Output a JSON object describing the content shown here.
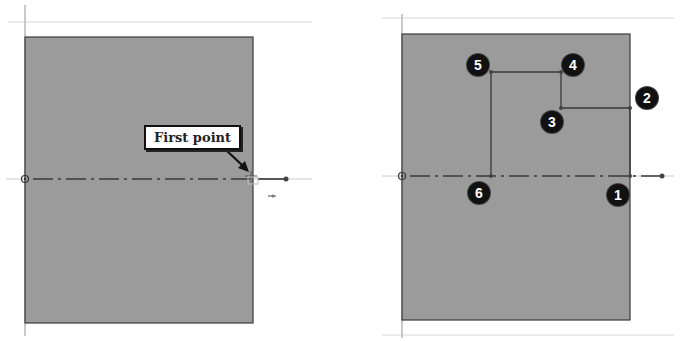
{
  "colors": {
    "background": "#ffffff",
    "sketch_face": "#9a9a9a",
    "sketch_edge": "#3a3a3a",
    "guide_line": "#d6d6d6",
    "centerline": "#444444",
    "badge_fill": "#111111",
    "badge_text": "#ffffff"
  },
  "left_panel": {
    "callout_label": "First point",
    "origin_icon": "origin-circle-icon",
    "cursor_icon": "crosshair-cursor-icon"
  },
  "right_panel": {
    "points": [
      {
        "label": "1",
        "x": 630,
        "y": 176
      },
      {
        "label": "2",
        "x": 630,
        "y": 108
      },
      {
        "label": "3",
        "x": 561,
        "y": 108
      },
      {
        "label": "4",
        "x": 561,
        "y": 72
      },
      {
        "label": "5",
        "x": 491,
        "y": 72
      },
      {
        "label": "6",
        "x": 491,
        "y": 176
      }
    ],
    "origin_icon": "origin-circle-icon"
  }
}
